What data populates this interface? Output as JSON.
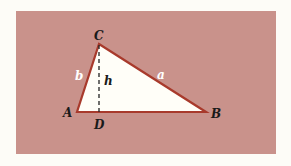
{
  "figure": {
    "type": "triangle-with-altitude",
    "vertices": {
      "A": {
        "label": "A",
        "x": 77,
        "y": 112
      },
      "B": {
        "label": "B",
        "x": 206,
        "y": 112
      },
      "C": {
        "label": "C",
        "x": 99,
        "y": 44
      },
      "D": {
        "label": "D",
        "x": 99,
        "y": 112
      }
    },
    "sides": {
      "a": {
        "label": "a",
        "from": "C",
        "to": "B"
      },
      "b": {
        "label": "b",
        "from": "A",
        "to": "C"
      }
    },
    "altitude": {
      "label": "h",
      "from": "C",
      "to": "D",
      "style": "dashed"
    },
    "colors": {
      "background": "#c9928b",
      "page": "#fdfcf7",
      "triangle_fill": "#fffef8",
      "edge": "#a83a2c",
      "vertex_label": "#1a1a1a",
      "side_label": "#ffffff"
    }
  }
}
